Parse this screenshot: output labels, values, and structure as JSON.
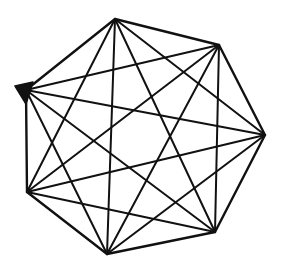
{
  "diagram": {
    "type": "complete-graph",
    "name": "K7",
    "background": "#ffffff",
    "stroke_color": "#111111",
    "vertices": [
      {
        "id": "A",
        "x": 115,
        "y": 19
      },
      {
        "id": "B",
        "x": 219,
        "y": 45
      },
      {
        "id": "C",
        "x": 265,
        "y": 135
      },
      {
        "id": "D",
        "x": 215,
        "y": 232
      },
      {
        "id": "E",
        "x": 107,
        "y": 254
      },
      {
        "id": "F",
        "x": 27,
        "y": 192
      },
      {
        "id": "G",
        "x": 26,
        "y": 90
      }
    ],
    "vertex_marker": {
      "vertex": "G",
      "shape": "triangle",
      "points": [
        [
          15,
          86
        ],
        [
          33,
          82
        ],
        [
          26,
          104
        ]
      ]
    }
  }
}
